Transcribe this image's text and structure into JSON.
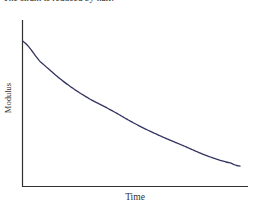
{
  "page": {
    "caption": "The strain is reduced by half.",
    "background_color": "#ffffff"
  },
  "chart_data": {
    "type": "line",
    "title": "",
    "subtitle": "",
    "xlabel": "Time",
    "ylabel": "Modulus",
    "grid": false,
    "legend": null,
    "axis_color": "#303030",
    "series": [
      {
        "name": "Modulus relaxation",
        "color": "#33335f",
        "description": "Exponential stress-relaxation decay of modulus over time",
        "x": [
          0.0,
          0.08,
          0.19,
          0.3,
          0.4,
          0.52,
          0.63,
          0.74,
          0.85,
          0.96,
          1.0
        ],
        "y": [
          1.0,
          0.86,
          0.72,
          0.61,
          0.53,
          0.43,
          0.35,
          0.28,
          0.21,
          0.16,
          0.14
        ]
      }
    ],
    "xlim": [
      0,
      1
    ],
    "ylim": [
      0,
      1
    ],
    "xticks": [],
    "yticks": [],
    "xticklabels": [],
    "yticklabels": []
  }
}
